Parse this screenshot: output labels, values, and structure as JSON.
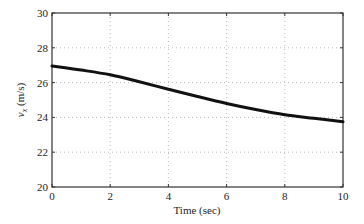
{
  "chart_data": {
    "type": "line",
    "title": "",
    "xlabel": "Time (sec)",
    "ylabel": "v_x (m/s)",
    "ylabel_main": "v",
    "ylabel_sub": "x",
    "ylabel_unit": " (m/s)",
    "xlim": [
      0,
      10
    ],
    "ylim": [
      20,
      30
    ],
    "xticks": [
      0,
      2,
      4,
      6,
      8,
      10
    ],
    "yticks": [
      20,
      22,
      24,
      26,
      28,
      30
    ],
    "grid": true,
    "legend": null,
    "series": [
      {
        "name": "v_x",
        "color": "#111111",
        "x": [
          0,
          1,
          2,
          3,
          4,
          5,
          6,
          7,
          8,
          9,
          10
        ],
        "values": [
          26.95,
          26.72,
          26.45,
          26.05,
          25.62,
          25.2,
          24.8,
          24.45,
          24.15,
          23.95,
          23.75
        ]
      }
    ]
  }
}
